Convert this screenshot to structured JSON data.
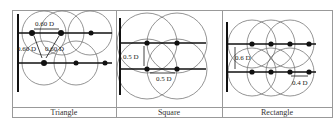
{
  "table": {
    "columns": [
      {
        "caption": "Triangle",
        "labels": [
          "0.60 D",
          "0.60 D",
          "0.60 D"
        ]
      },
      {
        "caption": "Square",
        "labels": [
          "0.5 D",
          "0.5 D"
        ]
      },
      {
        "caption": "Rectangle",
        "labels": [
          "0.6 D",
          "0.4 D"
        ]
      }
    ]
  },
  "colors": {
    "border": "#888888",
    "line": "#111111",
    "circle": "#555555",
    "text": "#222222"
  }
}
